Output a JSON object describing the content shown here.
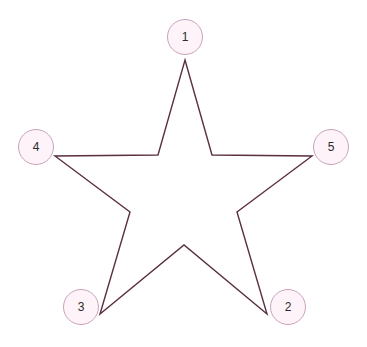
{
  "diagram": {
    "background_color": "#ffffff",
    "star": {
      "stroke_color": "#5a3040",
      "fill": "none",
      "stroke_width": 1.4,
      "points": "185,60 212,155 312,156 237,212 267,314 184,245 100,314 130,212 55,156 158,155"
    },
    "node_style": {
      "fill_color": "#fdf3f8",
      "border_color": "#c9a3bb",
      "text_color": "#2b2b2b",
      "radius": 18
    },
    "nodes": [
      {
        "label": "1",
        "x": 185,
        "y": 37,
        "name": "node-1"
      },
      {
        "label": "2",
        "x": 288,
        "y": 307,
        "name": "node-2"
      },
      {
        "label": "3",
        "x": 81,
        "y": 307,
        "name": "node-3"
      },
      {
        "label": "4",
        "x": 36,
        "y": 147,
        "name": "node-4"
      },
      {
        "label": "5",
        "x": 331,
        "y": 147,
        "name": "node-5"
      }
    ]
  }
}
